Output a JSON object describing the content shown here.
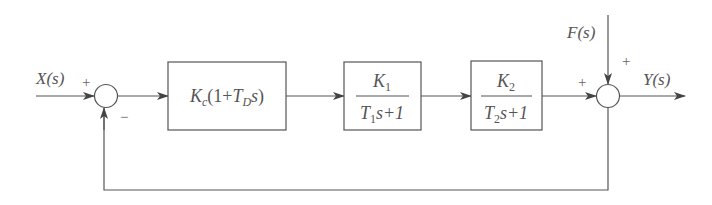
{
  "diagram": {
    "type": "block-diagram",
    "input": {
      "label": "X(s)",
      "sign": "+"
    },
    "feedback_sign": "−",
    "blocks": [
      {
        "id": "controller",
        "expr": "Kc(1+TDs)",
        "parts": {
          "k": "K",
          "k_sub": "c",
          "open": "(1+",
          "t": "T",
          "t_sub": "D",
          "s": "s",
          "close": ")"
        }
      },
      {
        "id": "plant1",
        "numerator": {
          "k": "K",
          "sub": "1"
        },
        "denominator": {
          "t": "T",
          "sub": "1",
          "rest": "s+1"
        }
      },
      {
        "id": "plant2",
        "numerator": {
          "k": "K",
          "sub": "2"
        },
        "denominator": {
          "t": "T",
          "sub": "2",
          "rest": "s+1"
        }
      }
    ],
    "disturbance": {
      "label": "F(s)",
      "sign": "+"
    },
    "forward_sign": "+",
    "output": {
      "label": "Y(s)"
    }
  }
}
